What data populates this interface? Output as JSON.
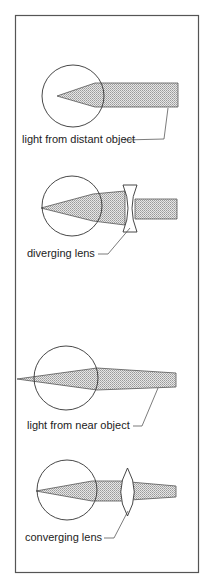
{
  "diagram": {
    "panels": [
      {
        "id": "distant-object",
        "label": "light from distant object",
        "lens": "none"
      },
      {
        "id": "diverging-lens",
        "label": "diverging lens",
        "lens": "diverging"
      },
      {
        "id": "near-object",
        "label": "light from near object",
        "lens": "none"
      },
      {
        "id": "converging-lens",
        "label": "converging lens",
        "lens": "converging"
      }
    ],
    "colors": {
      "beam_fill": "#c8c8c8",
      "line": "#333333",
      "background": "#ffffff"
    }
  }
}
